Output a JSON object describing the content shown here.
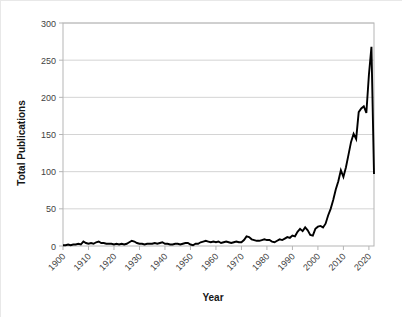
{
  "chart_data": {
    "type": "line",
    "title": "",
    "xlabel": "Year",
    "ylabel": "Total Publications",
    "xlim": [
      1900,
      2022
    ],
    "ylim": [
      0,
      300
    ],
    "ytick_labels": [
      "0",
      "50",
      "100",
      "150",
      "200",
      "250",
      "300"
    ],
    "yticks": [
      0,
      50,
      100,
      150,
      200,
      250,
      300
    ],
    "xtick_labels": [
      "1900",
      "1910",
      "1920",
      "1930",
      "1940",
      "1950",
      "1960",
      "1970",
      "1980",
      "1990",
      "2000",
      "2010",
      "2020"
    ],
    "xticks": [
      1900,
      1910,
      1920,
      1930,
      1940,
      1950,
      1960,
      1970,
      1980,
      1990,
      2000,
      2010,
      2020
    ],
    "grid": "horizontal",
    "legend": "none",
    "line_color": "#000000",
    "grid_color": "#d4d4d4",
    "frame_color": "#b5b5b5",
    "series": [
      {
        "name": "Total Publications",
        "x": [
          1900,
          1901,
          1902,
          1903,
          1904,
          1905,
          1906,
          1907,
          1908,
          1909,
          1910,
          1911,
          1912,
          1913,
          1914,
          1915,
          1916,
          1917,
          1918,
          1919,
          1920,
          1921,
          1922,
          1923,
          1924,
          1925,
          1926,
          1927,
          1928,
          1929,
          1930,
          1931,
          1932,
          1933,
          1934,
          1935,
          1936,
          1937,
          1938,
          1939,
          1940,
          1941,
          1942,
          1943,
          1944,
          1945,
          1946,
          1947,
          1948,
          1949,
          1950,
          1951,
          1952,
          1953,
          1954,
          1955,
          1956,
          1957,
          1958,
          1959,
          1960,
          1961,
          1962,
          1963,
          1964,
          1965,
          1966,
          1967,
          1968,
          1969,
          1970,
          1971,
          1972,
          1973,
          1974,
          1975,
          1976,
          1977,
          1978,
          1979,
          1980,
          1981,
          1982,
          1983,
          1984,
          1985,
          1986,
          1987,
          1988,
          1989,
          1990,
          1991,
          1992,
          1993,
          1994,
          1995,
          1996,
          1997,
          1998,
          1999,
          2000,
          2001,
          2002,
          2003,
          2004,
          2005,
          2006,
          2007,
          2008,
          2009,
          2010,
          2011,
          2012,
          2013,
          2014,
          2015,
          2016,
          2017,
          2018,
          2019,
          2020,
          2021,
          2022
        ],
        "values": [
          1,
          1,
          2,
          1,
          2,
          2,
          3,
          2,
          6,
          4,
          3,
          4,
          3,
          5,
          6,
          4,
          4,
          3,
          3,
          3,
          2,
          3,
          2,
          3,
          2,
          3,
          5,
          7,
          6,
          4,
          3,
          3,
          2,
          3,
          3,
          3,
          4,
          3,
          4,
          5,
          3,
          3,
          2,
          2,
          3,
          3,
          2,
          3,
          4,
          4,
          2,
          1,
          3,
          3,
          5,
          6,
          7,
          6,
          5,
          6,
          5,
          6,
          4,
          5,
          6,
          5,
          4,
          5,
          6,
          5,
          5,
          8,
          13,
          12,
          9,
          8,
          7,
          7,
          8,
          9,
          8,
          8,
          6,
          5,
          7,
          9,
          8,
          10,
          12,
          11,
          14,
          13,
          19,
          23,
          20,
          25,
          21,
          15,
          14,
          23,
          26,
          27,
          25,
          30,
          41,
          50,
          62,
          76,
          87,
          102,
          93,
          106,
          123,
          140,
          151,
          144,
          180,
          185,
          188,
          179,
          230,
          268,
          97
        ]
      }
    ]
  },
  "axes": {
    "y_title": "Total Publications",
    "x_title": "Year"
  }
}
